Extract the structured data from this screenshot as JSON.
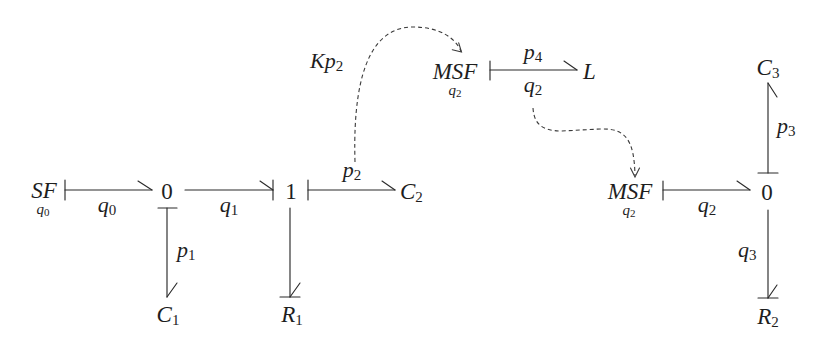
{
  "diagram_type": "bond graph",
  "nodes": {
    "sf": {
      "label": "SF",
      "under": {
        "base": "q",
        "sub": "0"
      }
    },
    "j0_left": {
      "label": "0"
    },
    "j1": {
      "label": "1"
    },
    "c1": {
      "base": "C",
      "sub": "1"
    },
    "r1": {
      "base": "R",
      "sub": "1"
    },
    "c2": {
      "base": "C",
      "sub": "2"
    },
    "msf_top": {
      "label": "MSF",
      "under": {
        "base": "q",
        "sub": "2"
      }
    },
    "l": {
      "label": "L"
    },
    "msf_right": {
      "label": "MSF",
      "under": {
        "base": "q",
        "sub": "2"
      }
    },
    "j0_right": {
      "label": "0"
    },
    "c3": {
      "base": "C",
      "sub": "3"
    },
    "r2": {
      "base": "R",
      "sub": "2"
    }
  },
  "bonds": {
    "sf_to_0": {
      "base": "q",
      "sub": "0"
    },
    "0_to_1": {
      "base": "q",
      "sub": "1"
    },
    "0_to_c1": {
      "base": "p",
      "sub": "1"
    },
    "1_to_c2": {
      "base": "p",
      "sub": "2"
    },
    "msf_to_l_top": {
      "base": "p",
      "sub": "4"
    },
    "msf_to_l_bottom": {
      "base": "q",
      "sub": "2"
    },
    "msf_to_0": {
      "base": "q",
      "sub": "2"
    },
    "0_to_c3": {
      "base": "p",
      "sub": "3"
    },
    "0_to_r2": {
      "base": "q",
      "sub": "3"
    }
  },
  "signals": {
    "kp2": {
      "base": "Kp",
      "sub": "2",
      "from": "p2",
      "to": "MSF (top)"
    },
    "q2_signal": {
      "from": "q2",
      "to": "MSF (right)"
    }
  }
}
